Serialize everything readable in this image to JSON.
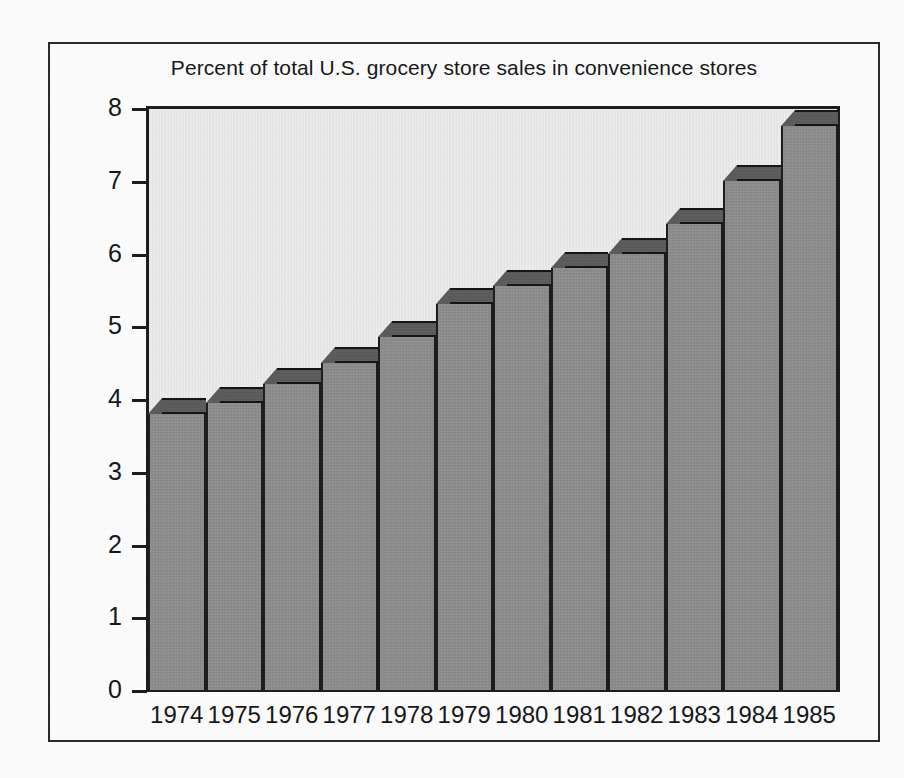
{
  "figure": {
    "title": "Percent of total U.S. grocery store sales in convenience stores",
    "frame": "rectangular-border",
    "style_note": "scanned halftone print, 3D beveled bars"
  },
  "colors": {
    "paper": "#fdfdfd",
    "frame_border": "#2a2a2a",
    "plot_background": "#ebebeb",
    "bar_face": "#8d8d8d",
    "bar_top_face": "#5c5c5c",
    "axis": "#1d1d1d",
    "text": "#15171a"
  },
  "chart_data": {
    "type": "bar",
    "title": "Percent of total U.S. grocery store sales in convenience stores",
    "xlabel": "",
    "ylabel": "",
    "categories": [
      "1974",
      "1975",
      "1976",
      "1977",
      "1978",
      "1979",
      "1980",
      "1981",
      "1982",
      "1983",
      "1984",
      "1985"
    ],
    "values": [
      3.8,
      3.95,
      4.2,
      4.5,
      4.85,
      5.3,
      5.55,
      5.8,
      6.0,
      6.4,
      7.0,
      7.75
    ],
    "ylim": [
      0,
      8
    ],
    "yticks": [
      0,
      1,
      2,
      3,
      4,
      5,
      6,
      7,
      8
    ],
    "ytick_labels": [
      "0",
      "1",
      "2",
      "3",
      "4",
      "5",
      "6",
      "7",
      "8"
    ],
    "xtick_labels": [
      "1974",
      "1975",
      "1976",
      "1977",
      "1978",
      "1979",
      "1980",
      "1981",
      "1982",
      "1983",
      "1984",
      "1985"
    ],
    "grid": false,
    "legend": null,
    "legend_position": "none",
    "bar_gap": 0,
    "annotations": []
  }
}
